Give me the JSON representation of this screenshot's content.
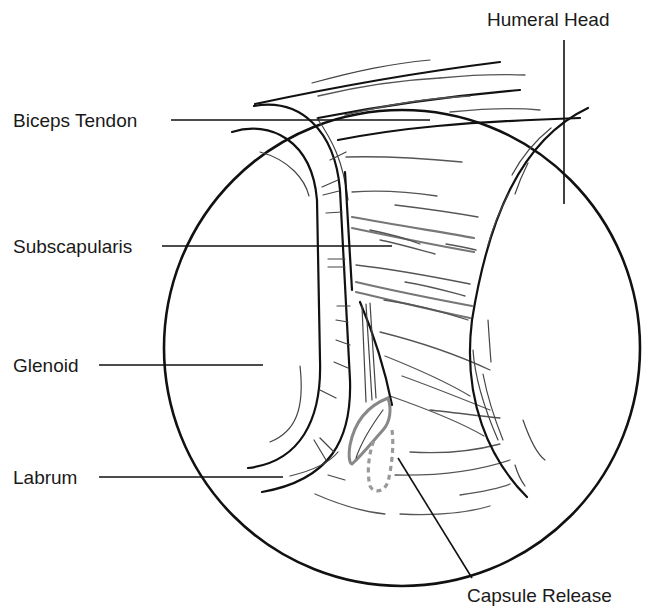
{
  "figure": {
    "type": "arthroscopic anatomical illustration",
    "view": "shoulder joint, circular arthroscopic field"
  },
  "labels": {
    "humeral_head": "Humeral Head",
    "biceps_tendon": "Biceps Tendon",
    "subscapularis": "Subscapularis",
    "glenoid": "Glenoid",
    "labrum": "Labrum",
    "capsule_release": "Capsule Release"
  },
  "colors": {
    "line": "#111111",
    "capsule_highlight": "#888888",
    "background": "#ffffff"
  }
}
